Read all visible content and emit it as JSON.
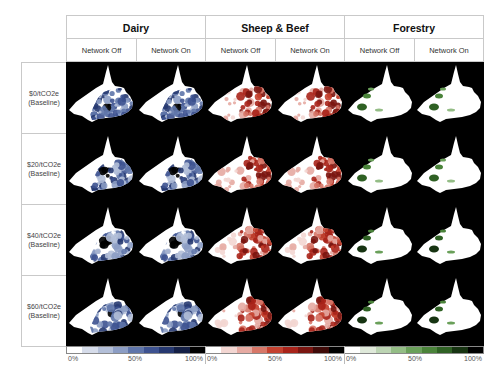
{
  "chart_data": {
    "type": "heatmap",
    "title": "",
    "column_groups": [
      {
        "label": "Dairy",
        "color_scale": [
          "#ffffff",
          "#d6dcea",
          "#b3bfd8",
          "#8c9dc4",
          "#5f75aa",
          "#3d5290",
          "#263870",
          "#141f45",
          "#000000"
        ]
      },
      {
        "label": "Sheep & Beef",
        "color_scale": [
          "#ffffff",
          "#f3d6d2",
          "#e6aaa2",
          "#d77768",
          "#c4412f",
          "#a8231a",
          "#7a1510",
          "#3f0a08",
          "#000000"
        ]
      },
      {
        "label": "Forestry",
        "color_scale": [
          "#ffffff",
          "#dfe9da",
          "#bcd4b3",
          "#94bd86",
          "#6aa05a",
          "#4a833a",
          "#2f6124",
          "#173412",
          "#000000"
        ]
      }
    ],
    "sub_columns": [
      "Network Off",
      "Network On"
    ],
    "rows": [
      "$0/tCO2e (Baseline)",
      "$20/tCO2e (Baseline)",
      "$40/tCO2e (Baseline)",
      "$60/tCO2e (Baseline)"
    ],
    "legend": {
      "min_label": "0%",
      "mid_label": "50%",
      "max_label": "100%",
      "range": [
        0,
        100
      ],
      "unit": "%"
    }
  },
  "header": {
    "groups": [
      {
        "label": "Dairy",
        "sub": [
          "Network Off",
          "Network On"
        ]
      },
      {
        "label": "Sheep & Beef",
        "sub": [
          "Network Off",
          "Network On"
        ]
      },
      {
        "label": "Forestry",
        "sub": [
          "Network Off",
          "Network On"
        ]
      }
    ]
  },
  "rows": [
    {
      "line1": "$0/tCO2e",
      "line2": "(Baseline)"
    },
    {
      "line1": "$20/tCO2e",
      "line2": "(Baseline)"
    },
    {
      "line1": "$40/tCO2e",
      "line2": "(Baseline)"
    },
    {
      "line1": "$60/tCO2e",
      "line2": "(Baseline)"
    }
  ],
  "legends": [
    {
      "min": "0%",
      "mid": "50%",
      "max": "100%"
    },
    {
      "min": "0%",
      "mid": "50%",
      "max": "100%"
    },
    {
      "min": "0%",
      "mid": "50%",
      "max": "100%"
    }
  ],
  "colors": {
    "map_background": "#000000",
    "region_base": "#ffffff",
    "dairy": "#3d5290",
    "sheep_beef": "#b52a1e",
    "forestry": "#4a833a",
    "grid_border": "#c9c9c9"
  }
}
